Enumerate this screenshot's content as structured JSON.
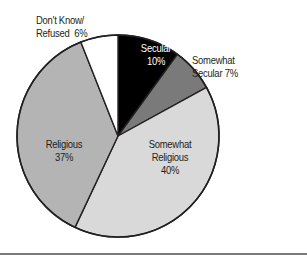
{
  "chart_data": {
    "type": "pie",
    "title": "",
    "start_angle_deg": 0,
    "direction": "clockwise",
    "center": [
      118,
      136
    ],
    "radius": 101,
    "slices": [
      {
        "name": "Secular",
        "value": 10,
        "color": "#000000"
      },
      {
        "name": "Somewhat Secular",
        "value": 7,
        "color": "#7a7a7a"
      },
      {
        "name": "Somewhat Religious",
        "value": 40,
        "color": "#d9d9d9"
      },
      {
        "name": "Religious",
        "value": 37,
        "color": "#b4b4b4"
      },
      {
        "name": "Don't Know/Refused",
        "value": 6,
        "color": "#ffffff"
      }
    ],
    "categories": [
      "Secular",
      "Somewhat Secular",
      "Somewhat Religious",
      "Religious",
      "Don't Know/Refused"
    ],
    "values": [
      10,
      7,
      40,
      37,
      6
    ],
    "unit": "%",
    "legend": "none (direct labels)"
  },
  "labels": {
    "secular": {
      "line1": "Secular",
      "line2": "10%"
    },
    "somewhat_secular": {
      "line1": "Somewhat",
      "line2": "Secular 7%"
    },
    "somewhat_religious": {
      "line1": "Somewhat",
      "line2": "Religious",
      "line3": "40%"
    },
    "religious": {
      "line1": "Religious",
      "line2": "37%"
    },
    "dont_know": {
      "line1": "Don't Know/",
      "line2": "Refused  6%"
    }
  },
  "style": {
    "outline_color": "#231f20",
    "baseline_color": "#7a7a7a"
  }
}
